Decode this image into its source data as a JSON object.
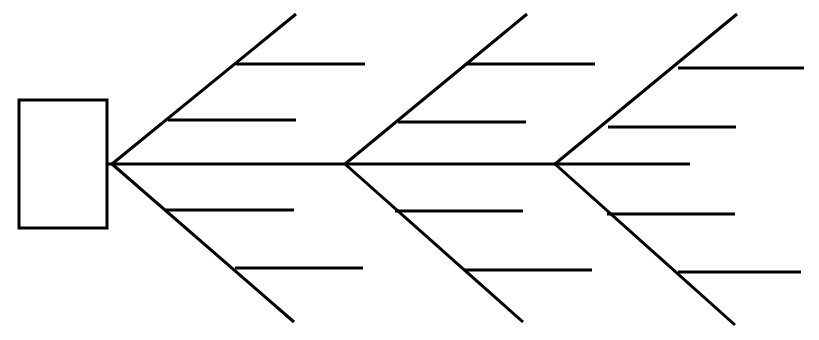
{
  "document": {
    "title": "Fishbone Diagram",
    "type": "ishikawa-cause-and-effect-diagram",
    "labels_present": false,
    "background_color": "#ffffff",
    "line_color": "#000000"
  },
  "canvas": {
    "width": 819,
    "height": 340
  },
  "style": {
    "stroke_color": "#000000",
    "spine_stroke_width": 3,
    "rib_stroke_width": 3,
    "sub_branch_stroke_width": 3,
    "head_box_stroke_width": 3,
    "head_box_fill": "#ffffff"
  },
  "head": {
    "label": "",
    "x": 19,
    "y": 100,
    "width": 88,
    "height": 128
  },
  "spine": {
    "label": "",
    "x1": 107,
    "y1": 164,
    "x2": 690,
    "y2": 164
  },
  "junctions": [
    {
      "name": "spine-tip-junction",
      "x": 112,
      "y": 164
    },
    {
      "name": "mid-junction",
      "x": 345,
      "y": 164
    },
    {
      "name": "right-junction",
      "x": 555,
      "y": 164
    }
  ],
  "ribs": [
    {
      "id": "rib-upper-1",
      "label": "",
      "direction": "up",
      "group": 1,
      "x1": 112,
      "y1": 164,
      "x2": 296,
      "y2": 14,
      "sub_branches": [
        {
          "id": "sub-upper-1-a",
          "label": "",
          "x1": 236,
          "y1": 64,
          "x2": 365,
          "y2": 64
        },
        {
          "id": "sub-upper-1-b",
          "label": "",
          "x1": 168,
          "y1": 120,
          "x2": 296,
          "y2": 120
        }
      ]
    },
    {
      "id": "rib-lower-1",
      "label": "",
      "direction": "down",
      "group": 1,
      "x1": 112,
      "y1": 164,
      "x2": 294,
      "y2": 322,
      "sub_branches": [
        {
          "id": "sub-lower-1-a",
          "label": "",
          "x1": 166,
          "y1": 210,
          "x2": 294,
          "y2": 210
        },
        {
          "id": "sub-lower-1-b",
          "label": "",
          "x1": 235,
          "y1": 268,
          "x2": 363,
          "y2": 268
        }
      ]
    },
    {
      "id": "rib-upper-2",
      "label": "",
      "direction": "up",
      "group": 2,
      "x1": 345,
      "y1": 164,
      "x2": 527,
      "y2": 14,
      "sub_branches": [
        {
          "id": "sub-upper-2-a",
          "label": "",
          "x1": 466,
          "y1": 64,
          "x2": 595,
          "y2": 64
        },
        {
          "id": "sub-upper-2-b",
          "label": "",
          "x1": 398,
          "y1": 122,
          "x2": 526,
          "y2": 122
        }
      ]
    },
    {
      "id": "rib-lower-2",
      "label": "",
      "direction": "down",
      "group": 2,
      "x1": 345,
      "y1": 164,
      "x2": 523,
      "y2": 322,
      "sub_branches": [
        {
          "id": "sub-lower-2-a",
          "label": "",
          "x1": 395,
          "y1": 211,
          "x2": 523,
          "y2": 211
        },
        {
          "id": "sub-lower-2-b",
          "label": "",
          "x1": 465,
          "y1": 270,
          "x2": 592,
          "y2": 270
        }
      ]
    },
    {
      "id": "rib-upper-3",
      "label": "",
      "direction": "up",
      "group": 3,
      "x1": 555,
      "y1": 164,
      "x2": 737,
      "y2": 14,
      "sub_branches": [
        {
          "id": "sub-upper-3-a",
          "label": "",
          "x1": 678,
          "y1": 68,
          "x2": 804,
          "y2": 68
        },
        {
          "id": "sub-upper-3-b",
          "label": "",
          "x1": 608,
          "y1": 127,
          "x2": 736,
          "y2": 127
        }
      ]
    },
    {
      "id": "rib-lower-3",
      "label": "",
      "direction": "down",
      "group": 3,
      "x1": 555,
      "y1": 164,
      "x2": 735,
      "y2": 325,
      "sub_branches": [
        {
          "id": "sub-lower-3-a",
          "label": "",
          "x1": 607,
          "y1": 214,
          "x2": 735,
          "y2": 214
        },
        {
          "id": "sub-lower-3-b",
          "label": "",
          "x1": 678,
          "y1": 272,
          "x2": 801,
          "y2": 272
        }
      ]
    }
  ]
}
